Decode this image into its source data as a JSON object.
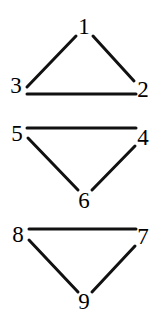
{
  "figure": {
    "width": 163,
    "height": 322,
    "background_color": "#ffffff",
    "ink_color": "#111111",
    "edge_width": 3
  },
  "graph": {
    "description": "Three disjoint triangle components with numbered vertices",
    "components": [
      {
        "name": "component-1",
        "vertices": [
          "1",
          "2",
          "3"
        ],
        "edges": [
          [
            "3",
            "1"
          ],
          [
            "1",
            "2"
          ],
          [
            "3",
            "2"
          ]
        ]
      },
      {
        "name": "component-2",
        "vertices": [
          "4",
          "5",
          "6"
        ],
        "edges": [
          [
            "5",
            "4"
          ],
          [
            "5",
            "6"
          ],
          [
            "6",
            "4"
          ]
        ]
      },
      {
        "name": "component-3",
        "vertices": [
          "7",
          "8",
          "9"
        ],
        "edges": [
          [
            "8",
            "7"
          ],
          [
            "8",
            "9"
          ],
          [
            "9",
            "7"
          ]
        ]
      }
    ],
    "nodes": [
      {
        "id": "1",
        "label": "1",
        "x": 84,
        "y": 26
      },
      {
        "id": "2",
        "label": "2",
        "x": 143,
        "y": 89
      },
      {
        "id": "3",
        "label": "3",
        "x": 16,
        "y": 85
      },
      {
        "id": "4",
        "label": "4",
        "x": 143,
        "y": 137
      },
      {
        "id": "5",
        "label": "5",
        "x": 17,
        "y": 133
      },
      {
        "id": "6",
        "label": "6",
        "x": 84,
        "y": 200
      },
      {
        "id": "7",
        "label": "7",
        "x": 143,
        "y": 236
      },
      {
        "id": "8",
        "label": "8",
        "x": 18,
        "y": 234
      },
      {
        "id": "9",
        "label": "9",
        "x": 84,
        "y": 301
      }
    ],
    "edge_segments": [
      {
        "name": "edge-3-1",
        "from": "3",
        "to": "1",
        "x1": 27,
        "y1": 87,
        "x2": 76,
        "y2": 36
      },
      {
        "name": "edge-1-2",
        "from": "1",
        "to": "2",
        "x1": 93,
        "y1": 36,
        "x2": 134,
        "y2": 81
      },
      {
        "name": "edge-3-2",
        "from": "3",
        "to": "2",
        "x1": 27,
        "y1": 94,
        "x2": 136,
        "y2": 94
      },
      {
        "name": "edge-5-4",
        "from": "5",
        "to": "4",
        "x1": 27,
        "y1": 128,
        "x2": 136,
        "y2": 128
      },
      {
        "name": "edge-5-6",
        "from": "5",
        "to": "6",
        "x1": 28,
        "y1": 138,
        "x2": 78,
        "y2": 190
      },
      {
        "name": "edge-6-4",
        "from": "6",
        "to": "4",
        "x1": 92,
        "y1": 190,
        "x2": 135,
        "y2": 146
      },
      {
        "name": "edge-8-7",
        "from": "8",
        "to": "7",
        "x1": 29,
        "y1": 229,
        "x2": 136,
        "y2": 229
      },
      {
        "name": "edge-8-9",
        "from": "8",
        "to": "9",
        "x1": 29,
        "y1": 240,
        "x2": 78,
        "y2": 292
      },
      {
        "name": "edge-9-7",
        "from": "9",
        "to": "7",
        "x1": 92,
        "y1": 292,
        "x2": 135,
        "y2": 246
      }
    ]
  }
}
